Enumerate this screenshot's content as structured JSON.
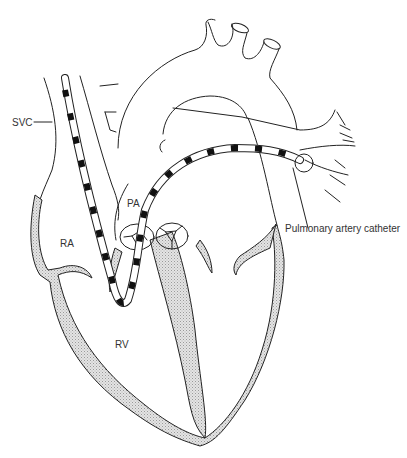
{
  "diagram": {
    "labels": {
      "svc": "SVC",
      "ra": "RA",
      "pa": "PA",
      "rv": "RV",
      "catheter": "Pulmonary artery catheter"
    },
    "colors": {
      "line": "#222222",
      "wall_fill": "#d9d9d9",
      "catheter_band": "#111111",
      "background": "#ffffff"
    }
  }
}
